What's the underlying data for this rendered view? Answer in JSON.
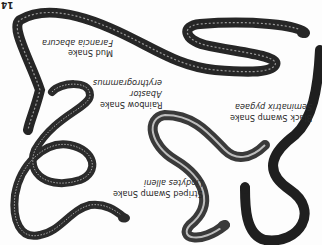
{
  "page_number": "14",
  "orientation": "rotated-180",
  "species": [
    {
      "common_name": "Mud Snake",
      "scientific_name": "Farancia abacura"
    },
    {
      "common_name": "Rainbow Snake",
      "scientific_name_line1": "Abastor",
      "scientific_name_line2": "erythrogrammus"
    },
    {
      "common_name": "Black Swamp Snake",
      "scientific_name": "Seminatrix pygaea"
    },
    {
      "common_name": "Striped Swamp Snake",
      "scientific_name": "Liodytes alleni"
    }
  ],
  "colors": {
    "background": "#fdfdfd",
    "snake_dark": "#262626",
    "snake_mid": "#4a4a4a",
    "stripe": "#bdbdbd",
    "text": "#2a2a2a"
  }
}
